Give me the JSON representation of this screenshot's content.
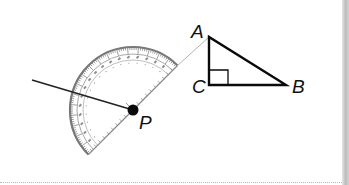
{
  "figure": {
    "points": {
      "P": {
        "label": "P",
        "x": 133,
        "y": 110
      },
      "A": {
        "label": "A",
        "x": 209,
        "y": 37
      },
      "B": {
        "label": "B",
        "x": 286,
        "y": 85
      },
      "C": {
        "label": "C",
        "x": 209,
        "y": 85
      }
    },
    "labels": {
      "A": "A",
      "B": "B",
      "C": "C",
      "P": "P"
    },
    "triangle": {
      "vertices": [
        "A",
        "C",
        "B"
      ],
      "right_angle_at": "C"
    },
    "protractor": {
      "center": "P",
      "outer_radius": 63,
      "inner_radius": 50,
      "baseline_direction": "toward A",
      "scale_degrees": 180
    },
    "ray": {
      "from": "P",
      "to_x": 32,
      "to_y": 80
    },
    "colors": {
      "line": "#111111",
      "protractor": "#7a7a7a",
      "sight_line": "#b0b0b0",
      "background": "#ffffff",
      "edge_strip": "#c4c4c4"
    }
  }
}
